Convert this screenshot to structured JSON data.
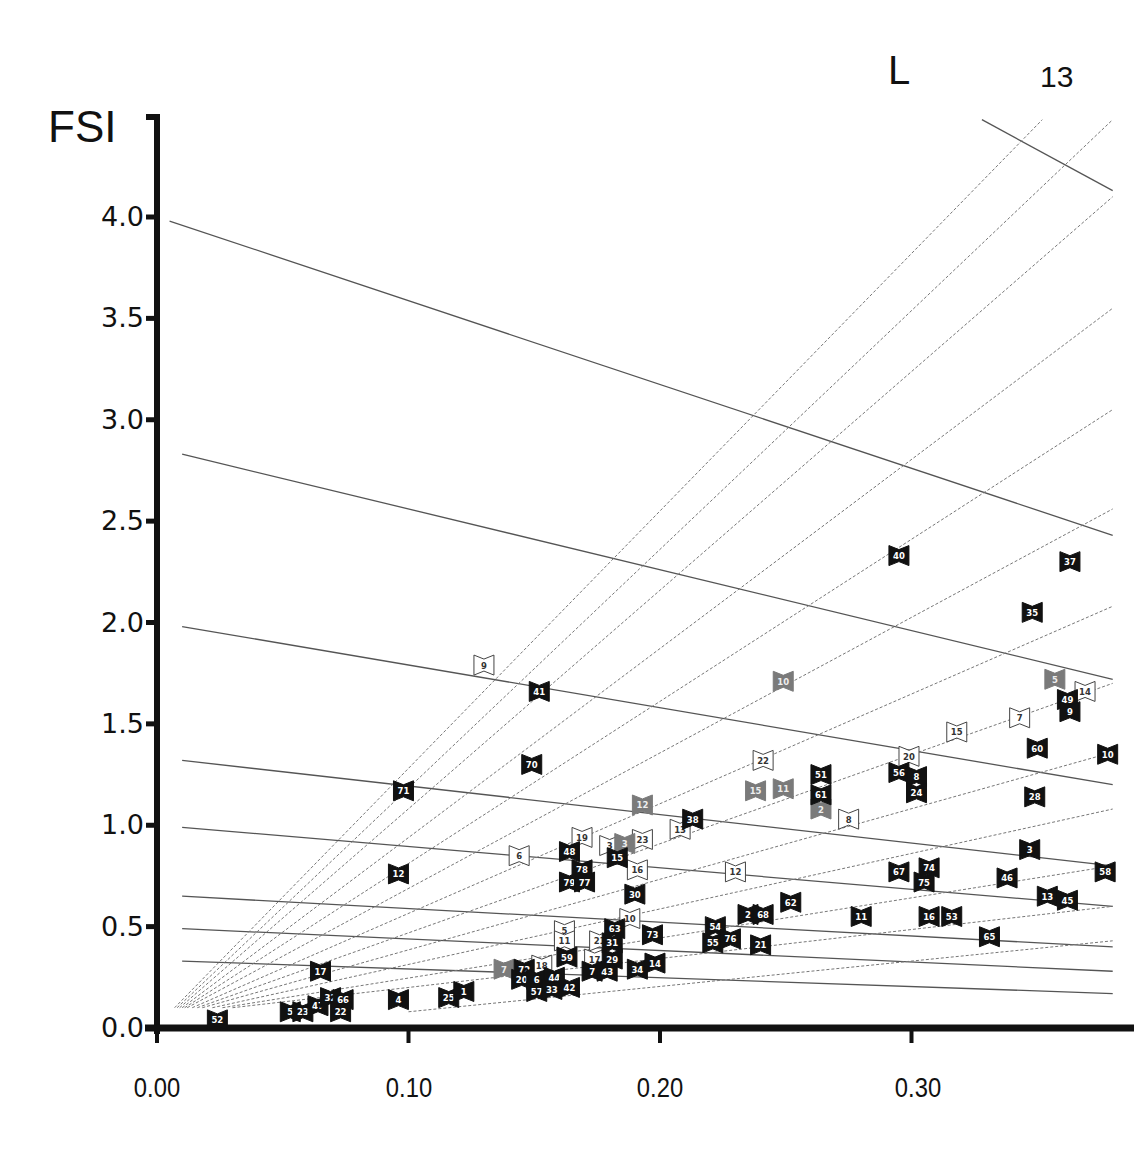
{
  "labels": {
    "y_axis_title": "FSI",
    "top_label": "L",
    "page_number": "13"
  },
  "colors": {
    "black_marker": "#111111",
    "gray_marker": "#7a7a7a",
    "white_marker_fill": "#ffffff",
    "white_marker_stroke": "#444444",
    "iso_line": "#555555",
    "ray_line": "#777777",
    "axis": "#111111"
  },
  "chart_data": {
    "type": "scatter",
    "title": "",
    "xlabel": "GSI",
    "ylabel": "FSI",
    "xlim": [
      0.0,
      0.38
    ],
    "ylim": [
      0.0,
      4.3
    ],
    "grid": false,
    "x_ticks": [
      "0.00",
      "0.10",
      "0.20",
      "0.30"
    ],
    "x_tick_values": [
      0.0,
      0.1,
      0.2,
      0.3
    ],
    "y_ticks": [
      "0.0",
      "0.5",
      "1.0",
      "1.5",
      "2.0",
      "2.5",
      "3.0",
      "3.5",
      "4.0"
    ],
    "y_tick_values": [
      0.0,
      0.5,
      1.0,
      1.5,
      2.0,
      2.5,
      3.0,
      3.5,
      4.0
    ],
    "annotations": [
      "L",
      "13"
    ],
    "legend": [
      {
        "style": "black",
        "description": "black bow-tie markers"
      },
      {
        "style": "gray",
        "description": "gray bow-tie markers"
      },
      {
        "style": "white",
        "description": "white outlined bow-tie markers"
      }
    ],
    "reference_lines": {
      "iso_lines_solid": [
        {
          "x1": 0.005,
          "y1": 3.98,
          "x2": 0.38,
          "y2": 2.43
        },
        {
          "x1": 0.01,
          "y1": 2.83,
          "x2": 0.38,
          "y2": 1.72
        },
        {
          "x1": 0.01,
          "y1": 1.98,
          "x2": 0.38,
          "y2": 1.2
        },
        {
          "x1": 0.01,
          "y1": 1.32,
          "x2": 0.38,
          "y2": 0.8
        },
        {
          "x1": 0.01,
          "y1": 0.99,
          "x2": 0.38,
          "y2": 0.6
        },
        {
          "x1": 0.01,
          "y1": 0.65,
          "x2": 0.38,
          "y2": 0.4
        },
        {
          "x1": 0.01,
          "y1": 0.49,
          "x2": 0.38,
          "y2": 0.28
        },
        {
          "x1": 0.01,
          "y1": 0.33,
          "x2": 0.38,
          "y2": 0.17
        },
        {
          "x1": 0.328,
          "y1": 4.48,
          "x2": 0.38,
          "y2": 4.13
        }
      ],
      "rays_dotted": [
        {
          "x1": 0.007,
          "y1": 0.1,
          "x2": 0.352,
          "y2": 4.48
        },
        {
          "x1": 0.008,
          "y1": 0.1,
          "x2": 0.38,
          "y2": 4.48
        },
        {
          "x1": 0.009,
          "y1": 0.1,
          "x2": 0.38,
          "y2": 4.1
        },
        {
          "x1": 0.01,
          "y1": 0.1,
          "x2": 0.38,
          "y2": 3.55
        },
        {
          "x1": 0.011,
          "y1": 0.1,
          "x2": 0.38,
          "y2": 3.05
        },
        {
          "x1": 0.012,
          "y1": 0.1,
          "x2": 0.38,
          "y2": 2.56
        },
        {
          "x1": 0.014,
          "y1": 0.1,
          "x2": 0.38,
          "y2": 2.08
        },
        {
          "x1": 0.016,
          "y1": 0.1,
          "x2": 0.38,
          "y2": 1.7
        },
        {
          "x1": 0.018,
          "y1": 0.1,
          "x2": 0.38,
          "y2": 1.36
        },
        {
          "x1": 0.022,
          "y1": 0.1,
          "x2": 0.38,
          "y2": 1.08
        },
        {
          "x1": 0.026,
          "y1": 0.1,
          "x2": 0.38,
          "y2": 0.8
        },
        {
          "x1": 0.03,
          "y1": 0.1,
          "x2": 0.38,
          "y2": 0.6
        },
        {
          "x1": 0.1,
          "y1": 0.08,
          "x2": 0.38,
          "y2": 0.43
        }
      ]
    },
    "series": [
      {
        "name": "black",
        "points": [
          {
            "label": "52",
            "x": 0.024,
            "y": 0.04
          },
          {
            "label": "5",
            "x": 0.053,
            "y": 0.08
          },
          {
            "label": "23",
            "x": 0.058,
            "y": 0.08
          },
          {
            "label": "47",
            "x": 0.064,
            "y": 0.11
          },
          {
            "label": "32",
            "x": 0.069,
            "y": 0.15
          },
          {
            "label": "66",
            "x": 0.074,
            "y": 0.14
          },
          {
            "label": "22",
            "x": 0.073,
            "y": 0.08
          },
          {
            "label": "17",
            "x": 0.065,
            "y": 0.28
          },
          {
            "label": "4",
            "x": 0.096,
            "y": 0.14
          },
          {
            "label": "25",
            "x": 0.116,
            "y": 0.15
          },
          {
            "label": "1",
            "x": 0.122,
            "y": 0.18
          },
          {
            "label": "12",
            "x": 0.096,
            "y": 0.76
          },
          {
            "label": "71",
            "x": 0.098,
            "y": 1.17
          },
          {
            "label": "41",
            "x": 0.152,
            "y": 1.66
          },
          {
            "label": "70",
            "x": 0.149,
            "y": 1.3
          },
          {
            "label": "72",
            "x": 0.146,
            "y": 0.29
          },
          {
            "label": "20",
            "x": 0.145,
            "y": 0.24
          },
          {
            "label": "6",
            "x": 0.151,
            "y": 0.24
          },
          {
            "label": "44",
            "x": 0.158,
            "y": 0.25
          },
          {
            "label": "57",
            "x": 0.151,
            "y": 0.18
          },
          {
            "label": "33",
            "x": 0.157,
            "y": 0.19
          },
          {
            "label": "42",
            "x": 0.164,
            "y": 0.2
          },
          {
            "label": "59",
            "x": 0.163,
            "y": 0.35
          },
          {
            "label": "7",
            "x": 0.173,
            "y": 0.28
          },
          {
            "label": "43",
            "x": 0.179,
            "y": 0.28
          },
          {
            "label": "29",
            "x": 0.181,
            "y": 0.34
          },
          {
            "label": "31",
            "x": 0.181,
            "y": 0.42
          },
          {
            "label": "63",
            "x": 0.182,
            "y": 0.49
          },
          {
            "label": "34",
            "x": 0.191,
            "y": 0.29
          },
          {
            "label": "14",
            "x": 0.198,
            "y": 0.32
          },
          {
            "label": "73",
            "x": 0.197,
            "y": 0.46
          },
          {
            "label": "30",
            "x": 0.19,
            "y": 0.66
          },
          {
            "label": "48",
            "x": 0.164,
            "y": 0.87
          },
          {
            "label": "78",
            "x": 0.169,
            "y": 0.78
          },
          {
            "label": "79",
            "x": 0.164,
            "y": 0.72
          },
          {
            "label": "77",
            "x": 0.17,
            "y": 0.72
          },
          {
            "label": "15",
            "x": 0.183,
            "y": 0.84
          },
          {
            "label": "38",
            "x": 0.213,
            "y": 1.03
          },
          {
            "label": "54",
            "x": 0.222,
            "y": 0.5
          },
          {
            "label": "55",
            "x": 0.221,
            "y": 0.42
          },
          {
            "label": "76",
            "x": 0.228,
            "y": 0.44
          },
          {
            "label": "2",
            "x": 0.235,
            "y": 0.56
          },
          {
            "label": "68",
            "x": 0.241,
            "y": 0.56
          },
          {
            "label": "21",
            "x": 0.24,
            "y": 0.41
          },
          {
            "label": "62",
            "x": 0.252,
            "y": 0.62
          },
          {
            "label": "51",
            "x": 0.264,
            "y": 1.25
          },
          {
            "label": "61",
            "x": 0.264,
            "y": 1.15
          },
          {
            "label": "11",
            "x": 0.28,
            "y": 0.55
          },
          {
            "label": "40",
            "x": 0.295,
            "y": 2.33
          },
          {
            "label": "56",
            "x": 0.295,
            "y": 1.26
          },
          {
            "label": "8",
            "x": 0.302,
            "y": 1.24
          },
          {
            "label": "24",
            "x": 0.302,
            "y": 1.16
          },
          {
            "label": "67",
            "x": 0.295,
            "y": 0.77
          },
          {
            "label": "74",
            "x": 0.307,
            "y": 0.79
          },
          {
            "label": "75",
            "x": 0.305,
            "y": 0.72
          },
          {
            "label": "16",
            "x": 0.307,
            "y": 0.55
          },
          {
            "label": "53",
            "x": 0.316,
            "y": 0.55
          },
          {
            "label": "65",
            "x": 0.331,
            "y": 0.45
          },
          {
            "label": "46",
            "x": 0.338,
            "y": 0.74
          },
          {
            "label": "3",
            "x": 0.347,
            "y": 0.88
          },
          {
            "label": "28",
            "x": 0.349,
            "y": 1.14
          },
          {
            "label": "60",
            "x": 0.35,
            "y": 1.38
          },
          {
            "label": "35",
            "x": 0.348,
            "y": 2.05
          },
          {
            "label": "37",
            "x": 0.363,
            "y": 2.3
          },
          {
            "label": "49",
            "x": 0.362,
            "y": 1.62
          },
          {
            "label": "9",
            "x": 0.363,
            "y": 1.56
          },
          {
            "label": "13",
            "x": 0.354,
            "y": 0.65
          },
          {
            "label": "45",
            "x": 0.362,
            "y": 0.63
          },
          {
            "label": "58",
            "x": 0.377,
            "y": 0.77
          },
          {
            "label": "10",
            "x": 0.378,
            "y": 1.35
          }
        ]
      },
      {
        "name": "gray",
        "points": [
          {
            "label": "7",
            "x": 0.138,
            "y": 0.29
          },
          {
            "label": "12",
            "x": 0.193,
            "y": 1.1
          },
          {
            "label": "3",
            "x": 0.186,
            "y": 0.91
          },
          {
            "label": "15",
            "x": 0.238,
            "y": 1.17
          },
          {
            "label": "11",
            "x": 0.249,
            "y": 1.18
          },
          {
            "label": "2",
            "x": 0.264,
            "y": 1.08
          },
          {
            "label": "10",
            "x": 0.249,
            "y": 1.71
          },
          {
            "label": "5",
            "x": 0.357,
            "y": 1.72
          }
        ]
      },
      {
        "name": "white",
        "points": [
          {
            "label": "9",
            "x": 0.13,
            "y": 1.79
          },
          {
            "label": "6",
            "x": 0.144,
            "y": 0.85
          },
          {
            "label": "19",
            "x": 0.169,
            "y": 0.94
          },
          {
            "label": "3",
            "x": 0.18,
            "y": 0.9
          },
          {
            "label": "23",
            "x": 0.193,
            "y": 0.93
          },
          {
            "label": "16",
            "x": 0.191,
            "y": 0.78
          },
          {
            "label": "13",
            "x": 0.208,
            "y": 0.98
          },
          {
            "label": "12",
            "x": 0.23,
            "y": 0.77
          },
          {
            "label": "22",
            "x": 0.241,
            "y": 1.32
          },
          {
            "label": "8",
            "x": 0.275,
            "y": 1.03
          },
          {
            "label": "20",
            "x": 0.299,
            "y": 1.34
          },
          {
            "label": "15",
            "x": 0.318,
            "y": 1.46
          },
          {
            "label": "7",
            "x": 0.343,
            "y": 1.53
          },
          {
            "label": "14",
            "x": 0.369,
            "y": 1.66
          },
          {
            "label": "5",
            "x": 0.162,
            "y": 0.48
          },
          {
            "label": "11",
            "x": 0.162,
            "y": 0.43
          },
          {
            "label": "21",
            "x": 0.176,
            "y": 0.43
          },
          {
            "label": "10",
            "x": 0.188,
            "y": 0.54
          },
          {
            "label": "18",
            "x": 0.153,
            "y": 0.31
          },
          {
            "label": "17",
            "x": 0.174,
            "y": 0.34
          }
        ]
      }
    ]
  }
}
